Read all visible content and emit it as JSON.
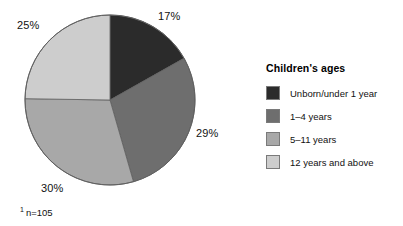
{
  "chart_data": {
    "type": "pie",
    "title": "",
    "legend_title": "Children's ages",
    "legend_position": "right",
    "categories": [
      "Unborn/under 1 year",
      "1–4 years",
      "5–11 years",
      "12 years and above"
    ],
    "values": [
      17,
      29,
      30,
      25
    ],
    "value_unit": "%",
    "data_labels": [
      "17%",
      "29%",
      "30%",
      "25%"
    ],
    "colors": [
      "#2b2b2b",
      "#6e6e6e",
      "#a8a8a8",
      "#cdcdcd"
    ],
    "start_angle_deg": 0,
    "direction": "clockwise",
    "footnote": "n=105",
    "footnote_marker": "1",
    "grid": false,
    "xlabel": "",
    "ylabel": ""
  },
  "pie": {
    "labels": {
      "s1": "17%",
      "s2": "29%",
      "s3": "30%",
      "s4": "25%"
    }
  },
  "legend": {
    "title": "Children's ages",
    "items": [
      {
        "label": "Unborn/under 1 year",
        "color": "#2b2b2b"
      },
      {
        "label": "1–4 years",
        "color": "#6e6e6e"
      },
      {
        "label": "5–11 years",
        "color": "#a8a8a8"
      },
      {
        "label": "12 years and above",
        "color": "#cdcdcd"
      }
    ]
  },
  "footnote": {
    "marker": "1",
    "text": "n=105"
  }
}
